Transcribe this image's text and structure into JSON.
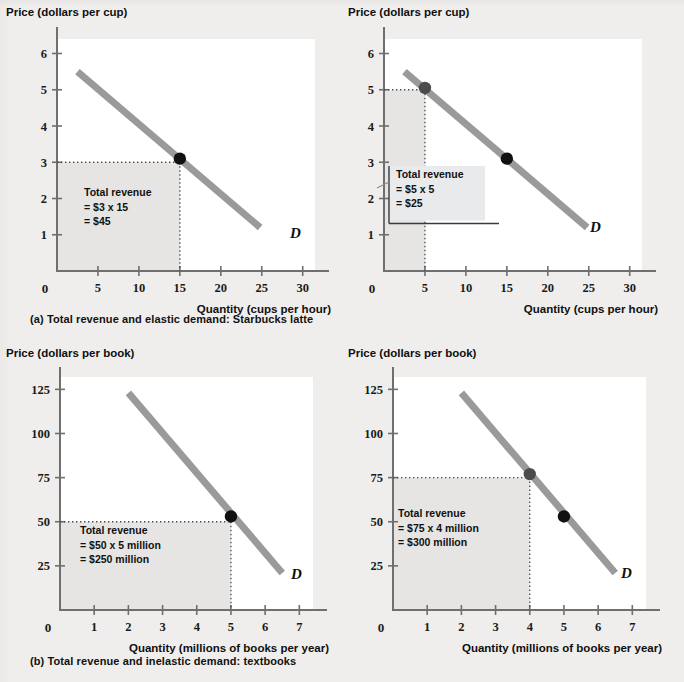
{
  "figure": {
    "background_color": "#efeeec",
    "curve_color": "#9a9a9a",
    "marker_color": "#111111",
    "shaded_area_color": "#e6e5e3",
    "callout_fill": "#e8eaec"
  },
  "captions": {
    "a": "(a) Total revenue and elastic demand: Starbucks latte",
    "b": "(b) Total revenue and inelastic demand: textbooks"
  },
  "chart_data": [
    {
      "id": "a-left",
      "type": "line",
      "title": "",
      "ylabel": "Price (dollars per cup)",
      "xlabel": "Quantity (cups per hour)",
      "xlim": [
        0,
        31.5
      ],
      "ylim": [
        0,
        6.4
      ],
      "xticks": [
        5,
        10,
        15,
        20,
        25,
        30
      ],
      "xtick_labels": [
        "5",
        "10",
        "15",
        "20",
        "25",
        "30"
      ],
      "yticks": [
        1,
        2,
        3,
        4,
        5,
        6
      ],
      "ytick_labels": [
        "1",
        "2",
        "3",
        "4",
        "5",
        "6"
      ],
      "origin_label": "0",
      "grid": false,
      "series": [
        {
          "name": "Demand",
          "label": "D",
          "x": [
            2.5,
            24.8
          ],
          "y": [
            5.5,
            1.2
          ]
        }
      ],
      "points": [
        {
          "x": 15,
          "y": 3.1,
          "style": "dark"
        }
      ],
      "guides": {
        "price": 3.0,
        "quantity": 15,
        "shade_from_origin": true
      },
      "note": {
        "lines": [
          "Total revenue",
          "= $3 x 15",
          "= $45"
        ],
        "boxed": false
      }
    },
    {
      "id": "a-right",
      "type": "line",
      "title": "",
      "ylabel": "Price (dollars per cup)",
      "xlabel": "Quantity (cups per hour)",
      "xlim": [
        0,
        31.5
      ],
      "ylim": [
        0,
        6.4
      ],
      "xticks": [
        5,
        10,
        15,
        20,
        25,
        30
      ],
      "xtick_labels": [
        "5",
        "10",
        "15",
        "20",
        "25",
        "30"
      ],
      "yticks": [
        1,
        2,
        3,
        4,
        5,
        6
      ],
      "ytick_labels": [
        "1",
        "2",
        "3",
        "4",
        "5",
        "6"
      ],
      "origin_label": "0",
      "grid": false,
      "series": [
        {
          "name": "Demand",
          "label": "D",
          "x": [
            2.5,
            24.8
          ],
          "y": [
            5.5,
            1.2
          ]
        }
      ],
      "points": [
        {
          "x": 5,
          "y": 5.05,
          "style": "grey"
        },
        {
          "x": 15,
          "y": 3.1,
          "style": "dark"
        }
      ],
      "guides": {
        "price": 5.0,
        "quantity": 5,
        "shade_from_origin": true
      },
      "note": {
        "lines": [
          "Total revenue",
          "= $5 x 5",
          "= $25"
        ],
        "boxed": true
      }
    },
    {
      "id": "b-left",
      "type": "line",
      "title": "",
      "ylabel": "Price (dollars per book)",
      "xlabel": "Quantity (millions of books per year)",
      "xlim": [
        0,
        7.4
      ],
      "ylim": [
        0,
        132
      ],
      "xticks": [
        1,
        2,
        3,
        4,
        5,
        6,
        7
      ],
      "xtick_labels": [
        "1",
        "2",
        "3",
        "4",
        "5",
        "6",
        "7"
      ],
      "yticks": [
        25,
        50,
        75,
        100,
        125
      ],
      "ytick_labels": [
        "25",
        "50",
        "75",
        "100",
        "125"
      ],
      "origin_label": "0",
      "grid": false,
      "series": [
        {
          "name": "Demand",
          "label": "D",
          "x": [
            2.0,
            6.5
          ],
          "y": [
            123,
            21
          ]
        }
      ],
      "points": [
        {
          "x": 5.0,
          "y": 53,
          "style": "dark"
        }
      ],
      "guides": {
        "price": 50,
        "quantity": 5,
        "shade_from_origin": true
      },
      "note": {
        "lines": [
          "Total revenue",
          "= $50 x 5 million",
          "= $250 million"
        ],
        "boxed": false
      }
    },
    {
      "id": "b-right",
      "type": "line",
      "title": "",
      "ylabel": "Price (dollars per book)",
      "xlabel": "Quantity (millions of books per year)",
      "xlim": [
        0,
        7.4
      ],
      "ylim": [
        0,
        132
      ],
      "xticks": [
        1,
        2,
        3,
        4,
        5,
        6,
        7
      ],
      "xtick_labels": [
        "1",
        "2",
        "3",
        "4",
        "5",
        "6",
        "7"
      ],
      "yticks": [
        25,
        50,
        75,
        100,
        125
      ],
      "ytick_labels": [
        "25",
        "50",
        "75",
        "100",
        "125"
      ],
      "origin_label": "0",
      "grid": false,
      "series": [
        {
          "name": "Demand",
          "label": "D",
          "x": [
            2.0,
            6.5
          ],
          "y": [
            123,
            21
          ]
        }
      ],
      "points": [
        {
          "x": 4.0,
          "y": 77,
          "style": "grey"
        },
        {
          "x": 5.0,
          "y": 53,
          "style": "dark"
        }
      ],
      "guides": {
        "price": 75,
        "quantity": 4,
        "shade_from_origin": true
      },
      "note": {
        "lines": [
          "Total revenue",
          "= $75 x 4 million",
          "= $300 million"
        ],
        "boxed": false
      }
    }
  ]
}
